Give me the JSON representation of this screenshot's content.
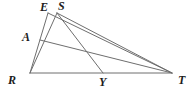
{
  "figure": {
    "kind": "geometry-diagram",
    "width": 195,
    "height": 96,
    "background_color": "#ffffff",
    "stroke_color": "#6e6e6e",
    "label_color": "#1c1c1c",
    "stroke_width": 1,
    "points": [
      {
        "id": "E",
        "label": "E",
        "x": 48,
        "y": 13,
        "label_x": 40,
        "label_y": 1
      },
      {
        "id": "S",
        "label": "S",
        "x": 57,
        "y": 13,
        "label_x": 58,
        "label_y": 0
      },
      {
        "id": "A",
        "label": "A",
        "x": 40,
        "y": 40,
        "label_x": 22,
        "label_y": 31
      },
      {
        "id": "R",
        "label": "R",
        "x": 30,
        "y": 73,
        "label_x": 8,
        "label_y": 74
      },
      {
        "id": "Y",
        "label": "Y",
        "x": 103,
        "y": 73,
        "label_x": 99,
        "label_y": 76
      },
      {
        "id": "T",
        "label": "T",
        "x": 172,
        "y": 73,
        "label_x": 178,
        "label_y": 74
      }
    ],
    "segments": [
      {
        "id": "RT",
        "from": "R",
        "to": "T"
      },
      {
        "id": "RE",
        "from": "R",
        "to": "E"
      },
      {
        "id": "RS",
        "from": "R",
        "to": "S"
      },
      {
        "id": "ET",
        "from": "E",
        "to": "T"
      },
      {
        "id": "ST",
        "from": "S",
        "to": "T"
      },
      {
        "id": "SY",
        "from": "S",
        "to": "Y"
      },
      {
        "id": "AT",
        "from": "A",
        "to": "T"
      }
    ]
  }
}
